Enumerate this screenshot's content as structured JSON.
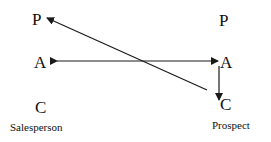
{
  "diagram": {
    "left": {
      "parent": "P",
      "adult": "A",
      "child": "C",
      "caption": "Salesperson"
    },
    "right": {
      "parent": "P",
      "adult": "A",
      "child": "C",
      "caption": "Prospect"
    },
    "arrows": [
      {
        "from": "right.adult",
        "to": "left.adult",
        "type": "double-headed"
      },
      {
        "from": "right.child",
        "to": "left.parent",
        "type": "single-headed"
      },
      {
        "from": "right.adult",
        "to": "right.child",
        "type": "single-headed"
      }
    ],
    "line_color": "#1a1a1a"
  }
}
